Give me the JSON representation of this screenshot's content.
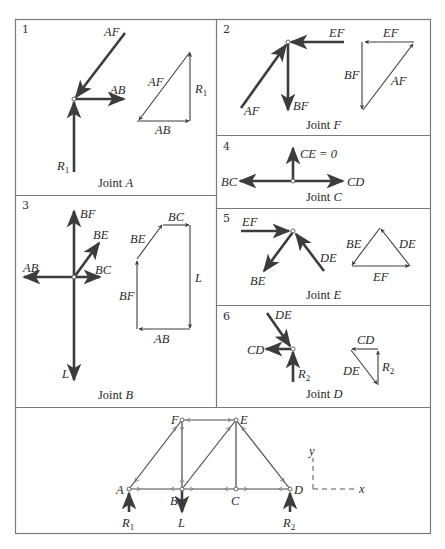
{
  "figure": {
    "panels": [
      {
        "number": "1",
        "caption_prefix": "Joint ",
        "caption_joint": "A",
        "labels": {
          "AF": "AF",
          "AB": "AB",
          "R1": "R",
          "R1_sub": "1",
          "poly_AF": "AF",
          "poly_AB": "AB",
          "poly_R1": "R",
          "poly_R1_sub": "1"
        }
      },
      {
        "number": "2",
        "caption_prefix": "Joint ",
        "caption_joint": "F",
        "labels": {
          "EF": "EF",
          "AF": "AF",
          "BF": "BF",
          "poly_EF": "EF",
          "poly_BF": "BF",
          "poly_AF": "AF"
        }
      },
      {
        "number": "3",
        "caption_prefix": "Joint ",
        "caption_joint": "B",
        "labels": {
          "BF": "BF",
          "BE": "BE",
          "AB": "AB",
          "BC": "BC",
          "L": "L",
          "poly_BC": "BC",
          "poly_BE": "BE",
          "poly_L": "L",
          "poly_BF": "BF",
          "poly_AB": "AB"
        }
      },
      {
        "number": "4",
        "caption_prefix": "Joint ",
        "caption_joint": "C",
        "labels": {
          "CE": "CE = 0",
          "BC": "BC",
          "CD": "CD"
        }
      },
      {
        "number": "5",
        "caption_prefix": "Joint ",
        "caption_joint": "E",
        "labels": {
          "EF": "EF",
          "BE": "BE",
          "DE": "DE",
          "poly_BE": "BE",
          "poly_DE": "DE",
          "poly_EF": "EF"
        }
      },
      {
        "number": "6",
        "caption_prefix": "Joint ",
        "caption_joint": "D",
        "labels": {
          "DE": "DE",
          "CD": "CD",
          "R2": "R",
          "R2_sub": "2",
          "poly_CD": "CD",
          "poly_DE": "DE",
          "poly_R2": "R",
          "poly_R2_sub": "2"
        }
      }
    ],
    "truss": {
      "joints": {
        "A": "A",
        "B": "B",
        "C": "C",
        "D": "D",
        "E": "E",
        "F": "F"
      },
      "loads": {
        "R1": "R",
        "R1_sub": "1",
        "L": "L",
        "R2": "R",
        "R2_sub": "2"
      },
      "axes": {
        "x": "x",
        "y": "y"
      }
    }
  }
}
